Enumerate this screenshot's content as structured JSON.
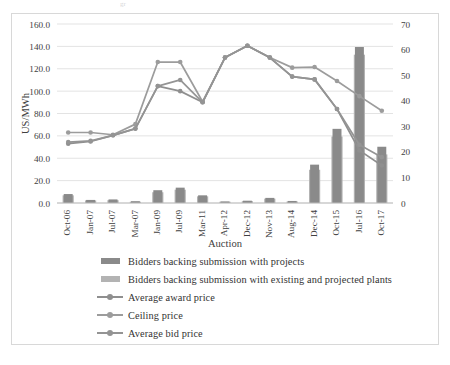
{
  "figure": {
    "top_artifact_text": "gr",
    "background": "#ffffff",
    "frame_border_color": "#d8d8d8"
  },
  "colors": {
    "bar_projects": "#8a8a8a",
    "bar_existing": "#b3b3b3",
    "line_award": "#8f8f8f",
    "line_ceiling": "#9c9c9c",
    "line_bid": "#949494",
    "gridline": "#e3e3e3",
    "axis_text": "#404040"
  },
  "axes": {
    "left": {
      "title": "US/MWh",
      "ticks": [
        "0.0",
        "20.0",
        "40.0",
        "60.0",
        "80.0",
        "100.0",
        "120.0",
        "140.0",
        "160.0"
      ],
      "min": 0,
      "max": 160,
      "step": 20
    },
    "right": {
      "title": "",
      "ticks": [
        "0",
        "10",
        "20",
        "30",
        "40",
        "50",
        "60",
        "70"
      ],
      "min": 0,
      "max": 70,
      "step": 10
    },
    "x": {
      "title": "Auction",
      "labels": [
        "Oct-06",
        "Jan-07",
        "Jul-07",
        "Mar-07",
        "Jan-09",
        "Jul-09",
        "Mar-11",
        "Apr-12",
        "Dec-12",
        "Nov-13",
        "Aug-14",
        "Dec-14",
        "Oct-15",
        "Jul-16",
        "Oct-17"
      ]
    }
  },
  "legend": {
    "items": [
      {
        "label": "Bidders backing submission with projects",
        "key": "bar",
        "color": "#8a8a8a",
        "name": "legend-bidders-projects"
      },
      {
        "label": "Bidders backing submission with existing and projected plants",
        "key": "bar",
        "color": "#b3b3b3",
        "name": "legend-bidders-existing"
      },
      {
        "label": "Average award price",
        "key": "line",
        "color": "#8f8f8f",
        "name": "legend-average-award-price"
      },
      {
        "label": "Ceiling price",
        "key": "line",
        "color": "#9c9c9c",
        "name": "legend-ceiling-price"
      },
      {
        "label": "Average bid price",
        "key": "line",
        "color": "#949494",
        "name": "legend-average-bid-price"
      }
    ]
  },
  "chart_data": {
    "type": "bar",
    "title": "",
    "subtitle": "",
    "xlabel": "Auction",
    "ylabel": "US/MWh",
    "y2label": "",
    "ylim": [
      0,
      160
    ],
    "y2lim": [
      0,
      70
    ],
    "grid": true,
    "legend_position": "below",
    "categories": [
      "Oct-06",
      "Jan-07",
      "Jul-07",
      "Mar-07",
      "Jan-09",
      "Jul-09",
      "Mar-11",
      "Apr-12",
      "Dec-12",
      "Nov-13",
      "Aug-14",
      "Dec-14",
      "Oct-15",
      "Jul-16",
      "Oct-17"
    ],
    "series": [
      {
        "name": "Bidders backing submission with projects",
        "type": "bar",
        "axis": "right",
        "values": [
          3.5,
          1.2,
          1.4,
          0.7,
          5.0,
          6.0,
          3.0,
          0.6,
          0.9,
          2.0,
          0.8,
          15.0,
          29.0,
          61.0,
          22.0
        ]
      },
      {
        "name": "Bidders backing submission with existing and projected plants",
        "type": "bar",
        "axis": "right",
        "values": [
          3.0,
          1.0,
          1.1,
          0.5,
          4.2,
          5.2,
          2.6,
          0.5,
          0.7,
          1.7,
          0.6,
          13.0,
          26.0,
          58.0,
          19.0
        ]
      },
      {
        "name": "Average award price",
        "type": "line",
        "axis": "left",
        "values": [
          53.0,
          55.0,
          60.5,
          66.5,
          104.5,
          100.0,
          90.0,
          130.0,
          140.5,
          130.0,
          113.0,
          110.5,
          84.0,
          47.0,
          33.5
        ]
      },
      {
        "name": "Ceiling price",
        "type": "line",
        "axis": "left",
        "values": [
          63.0,
          63.0,
          61.0,
          70.5,
          126.0,
          126.0,
          90.5,
          130.0,
          140.5,
          130.0,
          121.0,
          121.5,
          109.0,
          95.5,
          82.5
        ]
      },
      {
        "name": "Average bid price",
        "type": "line",
        "axis": "left",
        "values": [
          54.5,
          55.5,
          60.5,
          66.5,
          104.5,
          110.0,
          90.0,
          130.0,
          140.5,
          130.0,
          113.0,
          110.5,
          84.0,
          52.0,
          41.0
        ]
      }
    ]
  }
}
